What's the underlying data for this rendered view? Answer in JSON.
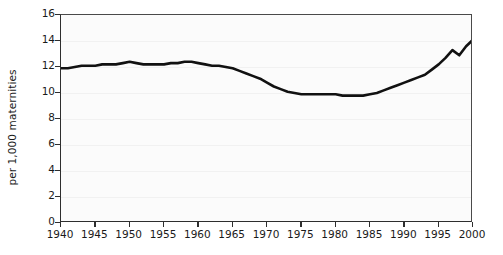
{
  "chart_data": {
    "type": "line",
    "title": "",
    "xlabel": "",
    "ylabel": "per 1,000 maternities",
    "xlim": [
      1940,
      2000
    ],
    "ylim": [
      0,
      16
    ],
    "grid": true,
    "legend": "none",
    "x_ticks": [
      1940,
      1945,
      1950,
      1955,
      1960,
      1965,
      1970,
      1975,
      1980,
      1985,
      1990,
      1995,
      2000
    ],
    "y_ticks": [
      0,
      2,
      4,
      6,
      8,
      10,
      12,
      14,
      16
    ],
    "series": [
      {
        "name": "Multiple maternity rate",
        "color": "#111111",
        "x": [
          1940,
          1941,
          1942,
          1943,
          1944,
          1945,
          1946,
          1947,
          1948,
          1949,
          1950,
          1951,
          1952,
          1953,
          1954,
          1955,
          1956,
          1957,
          1958,
          1959,
          1960,
          1961,
          1962,
          1963,
          1964,
          1965,
          1966,
          1967,
          1968,
          1969,
          1970,
          1971,
          1972,
          1973,
          1974,
          1975,
          1976,
          1977,
          1978,
          1979,
          1980,
          1981,
          1982,
          1983,
          1984,
          1985,
          1986,
          1987,
          1988,
          1989,
          1990,
          1991,
          1992,
          1993,
          1994,
          1995,
          1996,
          1997,
          1998,
          1999,
          2000
        ],
        "values": [
          11.9,
          11.9,
          12.0,
          12.1,
          12.1,
          12.1,
          12.2,
          12.2,
          12.2,
          12.3,
          12.4,
          12.3,
          12.2,
          12.2,
          12.2,
          12.2,
          12.3,
          12.3,
          12.4,
          12.4,
          12.3,
          12.2,
          12.1,
          12.1,
          12.0,
          11.9,
          11.7,
          11.5,
          11.3,
          11.1,
          10.8,
          10.5,
          10.3,
          10.1,
          10.0,
          9.9,
          9.9,
          9.9,
          9.9,
          9.9,
          9.9,
          9.8,
          9.8,
          9.8,
          9.8,
          9.9,
          10.0,
          10.2,
          10.4,
          10.6,
          10.8,
          11.0,
          11.2,
          11.4,
          11.8,
          12.2,
          12.7,
          13.3,
          12.9,
          13.6,
          14.1
        ]
      }
    ]
  }
}
